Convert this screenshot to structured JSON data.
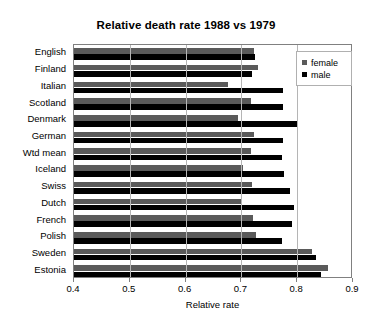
{
  "chart_data": {
    "type": "bar",
    "orientation": "horizontal",
    "title": "Relative death rate 1988 vs 1979",
    "xlabel": "Relative rate",
    "ylabel": "",
    "xlim": [
      0.4,
      0.9
    ],
    "xticks": [
      "0.4",
      "0.5",
      "0.6",
      "0.7",
      "0.8",
      "0.9"
    ],
    "xtick_values": [
      0.4,
      0.5,
      0.6,
      0.7,
      0.8,
      0.9
    ],
    "grid": true,
    "legend_position": "top-right",
    "categories": [
      "English",
      "Finland",
      "Italian",
      "Scotland",
      "Denmark",
      "German",
      "Wtd mean",
      "Iceland",
      "Swiss",
      "Dutch",
      "French",
      "Polish",
      "Sweden",
      "Estonia"
    ],
    "series": [
      {
        "name": "female",
        "color": "#5a5a5a",
        "values": [
          0.723,
          0.73,
          0.676,
          0.718,
          0.694,
          0.722,
          0.718,
          0.702,
          0.719,
          0.701,
          0.72,
          0.727,
          0.827,
          0.855
        ]
      },
      {
        "name": "male",
        "color": "#000000",
        "values": [
          0.724,
          0.719,
          0.774,
          0.774,
          0.802,
          0.774,
          0.773,
          0.776,
          0.787,
          0.795,
          0.791,
          0.772,
          0.833,
          0.843
        ]
      }
    ]
  },
  "legend": {
    "items": [
      {
        "label": "female",
        "color": "#5a5a5a"
      },
      {
        "label": "male",
        "color": "#000000"
      }
    ]
  }
}
